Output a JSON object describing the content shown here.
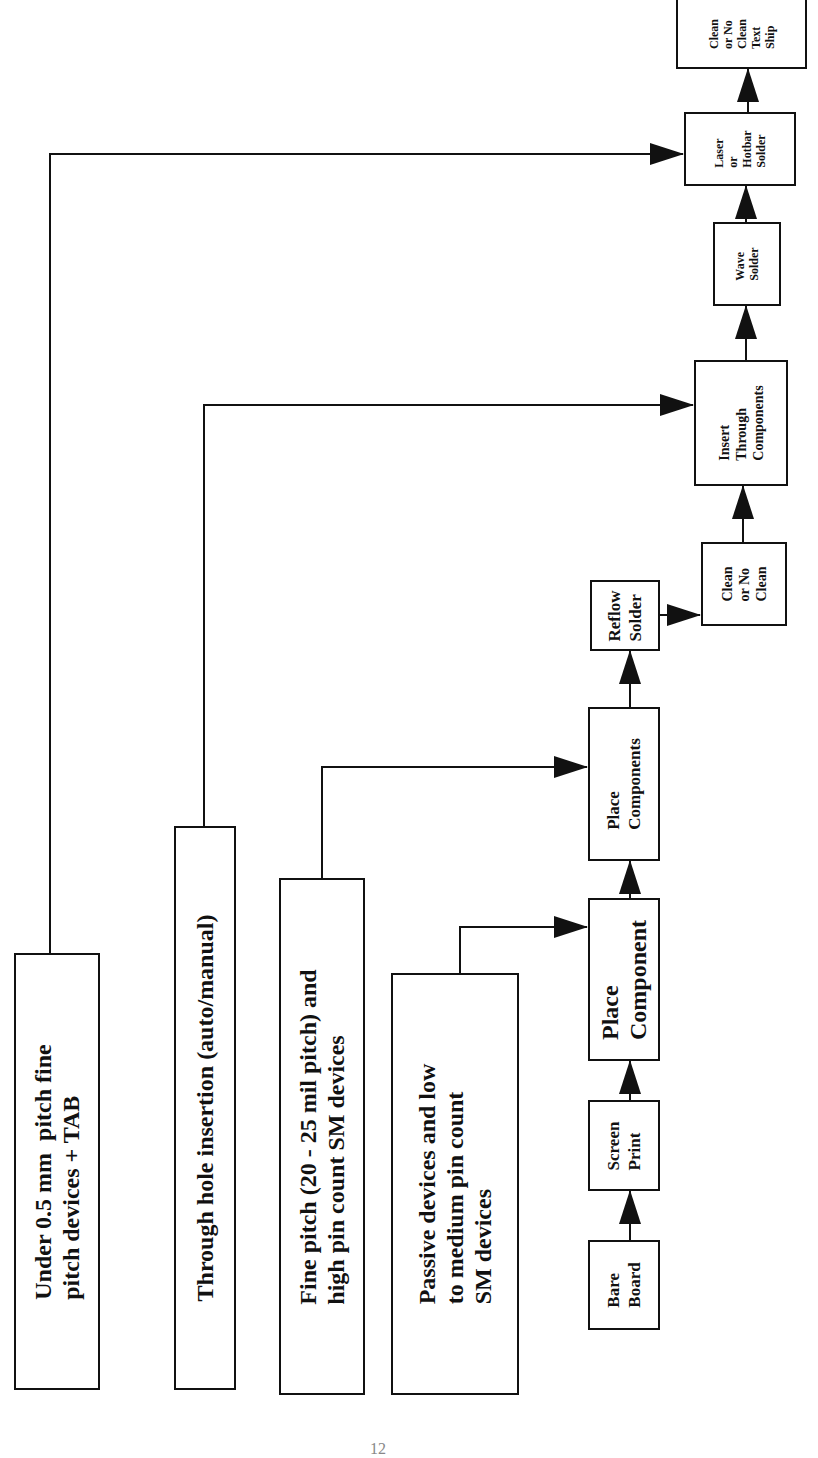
{
  "diagram": {
    "type": "process-flowchart",
    "orientation": "rotated-90-ccw",
    "inputs": [
      {
        "id": "under-05mm",
        "label": "Under 0.5 mm  pitch fine\npitch devices + TAB",
        "feeds": "laser-hotbar"
      },
      {
        "id": "through-hole",
        "label": "Through hole insertion (auto/manual)",
        "feeds": "insert-through"
      },
      {
        "id": "fine-pitch",
        "label": "Fine pitch (20 - 25 mil pitch) and\nhigh pin count SM devices",
        "feeds": "place-components"
      },
      {
        "id": "passive",
        "label": "Passive devices and low\nto medium pin count\nSM devices",
        "feeds": "place-component"
      }
    ],
    "steps": [
      {
        "id": "bare-board",
        "label": "Bare\nBoard"
      },
      {
        "id": "screen-print",
        "label": "Screen\nPrint"
      },
      {
        "id": "place-component",
        "label": "Place\nComponent"
      },
      {
        "id": "place-components",
        "label": "Place\nComponents"
      },
      {
        "id": "reflow",
        "label": "Reflow\nSolder"
      },
      {
        "id": "clean1",
        "label": "Clean\nor No\nClean"
      },
      {
        "id": "insert-through",
        "label": "Insert\nThrough\nComponents"
      },
      {
        "id": "wave",
        "label": "Wave\nSolder"
      },
      {
        "id": "laser-hotbar",
        "label": "Laser\nor\nHotbar\nSolder"
      },
      {
        "id": "final",
        "label": "Clean\nor No\nClean\nText\nShip"
      }
    ],
    "flow": [
      [
        "bare-board",
        "screen-print"
      ],
      [
        "screen-print",
        "place-component"
      ],
      [
        "place-component",
        "place-components"
      ],
      [
        "place-components",
        "reflow"
      ],
      [
        "reflow",
        "clean1"
      ],
      [
        "clean1",
        "insert-through"
      ],
      [
        "insert-through",
        "wave"
      ],
      [
        "wave",
        "laser-hotbar"
      ],
      [
        "laser-hotbar",
        "final"
      ]
    ],
    "line_color": "#111111",
    "page_number": "12"
  }
}
